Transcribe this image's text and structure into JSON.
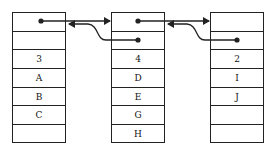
{
  "diagram": {
    "type": "doubly-linked list of blocks",
    "blocks": [
      {
        "id": "block-1",
        "cells": [
          "",
          "",
          "3",
          "A",
          "B",
          "C",
          ""
        ]
      },
      {
        "id": "block-2",
        "cells": [
          "",
          "",
          "4",
          "D",
          "E",
          "G",
          "H"
        ]
      },
      {
        "id": "block-3",
        "cells": [
          "",
          "",
          "2",
          "I",
          "J",
          "",
          ""
        ]
      }
    ],
    "links": [
      {
        "from": "block-1.next",
        "to": "block-2",
        "direction": "forward"
      },
      {
        "from": "block-2.prev",
        "to": "block-1",
        "direction": "backward"
      },
      {
        "from": "block-2.next",
        "to": "block-3",
        "direction": "forward"
      },
      {
        "from": "block-3.prev",
        "to": "block-2",
        "direction": "backward"
      }
    ],
    "colors": {
      "line": "#222222",
      "background": "#ffffff"
    }
  }
}
